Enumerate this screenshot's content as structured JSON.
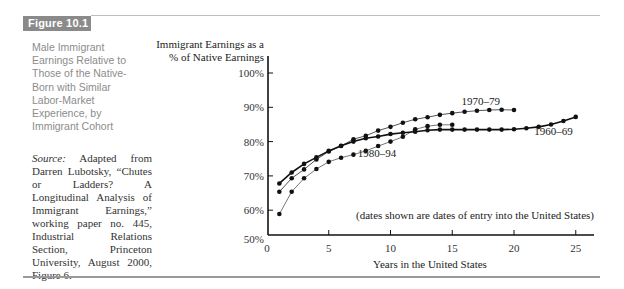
{
  "figure": {
    "label": "Figure 10.1",
    "caption": "Male Immigrant Earnings Relative to Those of the Native-Born with Similar Labor-Market Experience, by Immigrant Cohort",
    "source_label": "Source:",
    "source_text": " Adapted from Darren Lubotsky, “Chutes or Ladders? A Longitudinal Analysis of Immigrant Earnings,” working paper no. 445, Industrial Relations Section, Princeton University, August 2000, Figure 6."
  },
  "chart_data": {
    "type": "line",
    "title": "Male Immigrant Earnings Relative to Those of the Native-Born with Similar Labor-Market Experience, by Immigrant Cohort",
    "xlabel": "Years in the United States",
    "ylabel": "Immigrant Earnings as a % of Native Earnings",
    "ylabel_lines": [
      "Immigrant Earnings as a",
      "% of Native Earnings"
    ],
    "xlim": [
      0,
      26
    ],
    "ylim": [
      50,
      100
    ],
    "y_axis_break": true,
    "grid": false,
    "x_ticks": [
      0,
      5,
      10,
      15,
      20,
      25
    ],
    "y_ticks": [
      {
        "value": 50,
        "label": "50%"
      },
      {
        "value": 60,
        "label": "60%"
      },
      {
        "value": 70,
        "label": "70%"
      },
      {
        "value": 80,
        "label": "80%"
      },
      {
        "value": 90,
        "label": "90%"
      },
      {
        "value": 100,
        "label": "100%"
      }
    ],
    "annotation": "(dates shown are dates of entry into the United States)",
    "series": [
      {
        "name": "1960–69",
        "color": "#111111",
        "stroke_width": 1.6,
        "x": [
          1,
          2,
          3,
          4,
          5,
          6,
          7,
          8,
          9,
          10,
          11,
          12,
          13,
          14,
          15,
          16,
          17,
          18,
          19,
          20,
          21,
          22,
          23,
          24,
          25
        ],
        "values": [
          67.8,
          71.0,
          73.5,
          75.4,
          77.3,
          78.8,
          80.0,
          81.0,
          81.5,
          82.2,
          82.6,
          82.9,
          83.3,
          83.5,
          83.5,
          83.5,
          83.5,
          83.5,
          83.5,
          83.6,
          83.9,
          84.3,
          85.0,
          86.0,
          87.2
        ],
        "label_pos": {
          "x": 23.2,
          "y": 82.0
        }
      },
      {
        "name": "1970–79",
        "color": "#555555",
        "stroke_width": 1.0,
        "x": [
          1,
          2,
          3,
          4,
          5,
          6,
          7,
          8,
          9,
          10,
          11,
          12,
          13,
          14,
          15,
          16,
          17,
          18,
          19,
          20
        ],
        "values": [
          65.4,
          69.3,
          71.9,
          74.8,
          77.1,
          78.7,
          80.7,
          81.7,
          83.2,
          84.3,
          85.5,
          86.5,
          87.1,
          87.8,
          88.3,
          88.7,
          89.0,
          89.2,
          89.3,
          89.2
        ],
        "label_pos": {
          "x": 17.3,
          "y": 90.6
        }
      },
      {
        "name": "1980–94",
        "color": "#777777",
        "stroke_width": 1.0,
        "x": [
          1,
          2,
          3,
          4,
          5,
          6,
          7,
          8,
          9,
          10,
          11,
          12,
          13,
          14,
          15
        ],
        "values": [
          58.9,
          65.4,
          69.3,
          72.0,
          74.1,
          75.3,
          76.2,
          77.3,
          78.7,
          80.0,
          81.4,
          83.6,
          84.5,
          84.9,
          84.9
        ],
        "label_pos": {
          "x": 8.9,
          "y": 75.5
        }
      }
    ]
  }
}
